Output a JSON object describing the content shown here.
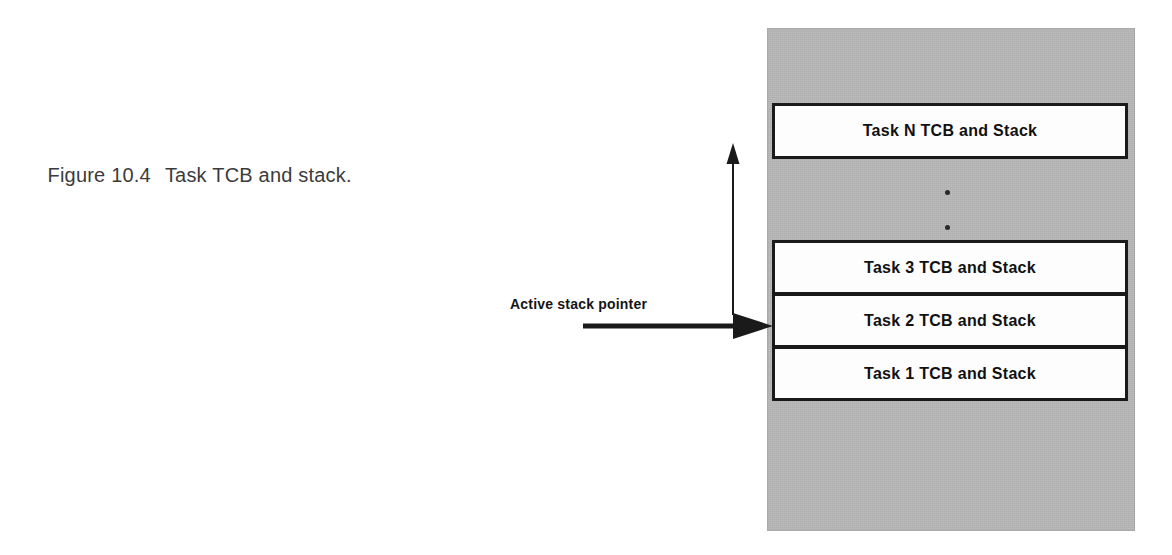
{
  "figure": {
    "caption_label": "Figure 10.4",
    "caption_text": "Task TCB and stack."
  },
  "diagram": {
    "type": "memory-layout",
    "memory_region_name": "task memory area",
    "colors": {
      "memory_fill": "#b8b8b8",
      "task_box_fill": "#fdfdfd",
      "line": "#1a1a1a",
      "text": "#111111"
    },
    "task_blocks": [
      {
        "id": "task-n",
        "label": "Task N TCB and Stack"
      },
      {
        "id": "task-3",
        "label": "Task 3 TCB and Stack"
      },
      {
        "id": "task-2",
        "label": "Task 2 TCB and Stack"
      },
      {
        "id": "task-1",
        "label": "Task 1 TCB and Stack"
      }
    ],
    "ellipsis": {
      "dot_count": 2,
      "meaning": "continuation between Task 3 and Task N"
    },
    "annotations": {
      "active_stack_pointer_label": "Active stack pointer",
      "pointer_arrow_direction": "right",
      "pointer_arrow_target": "task-1",
      "growth_arrow_direction": "up"
    }
  }
}
